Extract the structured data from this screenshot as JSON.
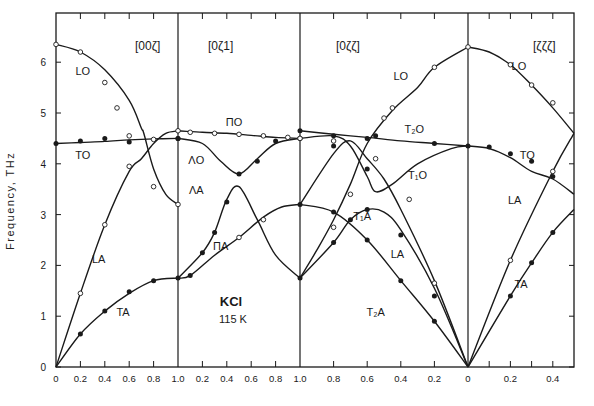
{
  "chart_data": {
    "type": "line",
    "title": "",
    "subtitle": "KCl 115 K",
    "annotation": {
      "material": "KCl",
      "temperature": "115 K"
    },
    "xlabel": "",
    "ylabel": "Frequency,   THz",
    "ylim": [
      0,
      7
    ],
    "yticks": [
      0,
      1,
      2,
      3,
      4,
      5,
      6
    ],
    "grid": false,
    "legend": "none (curve labels inline)",
    "sections": [
      {
        "label": "[00ζ]",
        "xticks": [
          "0",
          "0.2",
          "0.4",
          "0.6",
          "0.8",
          "1.0"
        ],
        "range": [
          0,
          1.0
        ]
      },
      {
        "label": "[0ζ1]",
        "xticks": [
          "0.2",
          "0.4",
          "0.6",
          "0.8",
          "1.0"
        ],
        "range": [
          0,
          1.0
        ]
      },
      {
        "label": "[0ζζ]",
        "xticks": [
          "0.8",
          "0.6",
          "0.4",
          "0.2",
          "0"
        ],
        "range": [
          1.0,
          0
        ]
      },
      {
        "label": "[ζζζ]",
        "xticks": [
          "0.2",
          "0.4"
        ],
        "range": [
          0,
          0.5
        ]
      }
    ],
    "series": [
      {
        "name": "LO",
        "section": 0,
        "points": [
          [
            0,
            6.35
          ],
          [
            0.2,
            6.2
          ],
          [
            0.4,
            5.85
          ],
          [
            0.6,
            5.25
          ],
          [
            0.7,
            4.7
          ],
          [
            0.72,
            4.6
          ],
          [
            0.8,
            3.9
          ],
          [
            0.9,
            3.4
          ],
          [
            1.0,
            3.2
          ]
        ]
      },
      {
        "name": "TO",
        "section": 0,
        "points": [
          [
            0,
            4.4
          ],
          [
            0.2,
            4.42
          ],
          [
            0.4,
            4.44
          ],
          [
            0.6,
            4.47
          ],
          [
            0.8,
            4.49
          ],
          [
            1.0,
            4.5
          ]
        ]
      },
      {
        "name": "LA",
        "section": 0,
        "points": [
          [
            0,
            0
          ],
          [
            0.2,
            1.45
          ],
          [
            0.4,
            2.8
          ],
          [
            0.6,
            3.85
          ],
          [
            0.7,
            4.1
          ],
          [
            0.8,
            4.4
          ],
          [
            0.9,
            4.6
          ],
          [
            1.0,
            4.65
          ]
        ]
      },
      {
        "name": "TA",
        "section": 0,
        "points": [
          [
            0,
            0
          ],
          [
            0.2,
            0.65
          ],
          [
            0.4,
            1.1
          ],
          [
            0.6,
            1.45
          ],
          [
            0.8,
            1.7
          ],
          [
            1.0,
            1.75
          ]
        ]
      },
      {
        "name": "ΠO",
        "section": 1,
        "points": [
          [
            0,
            4.65
          ],
          [
            0.2,
            4.62
          ],
          [
            0.4,
            4.6
          ],
          [
            0.6,
            4.56
          ],
          [
            0.8,
            4.52
          ],
          [
            1.0,
            4.5
          ]
        ]
      },
      {
        "name": "ΛO",
        "section": 1,
        "points": [
          [
            0,
            4.5
          ],
          [
            0.2,
            4.4
          ],
          [
            0.35,
            4.05
          ],
          [
            0.5,
            3.8
          ],
          [
            0.65,
            4.1
          ],
          [
            0.8,
            4.4
          ],
          [
            1.0,
            4.5
          ]
        ]
      },
      {
        "name": "ΛA",
        "section": 1,
        "points": [
          [
            0,
            1.75
          ],
          [
            0.2,
            2.25
          ],
          [
            0.3,
            2.65
          ],
          [
            0.4,
            3.3
          ],
          [
            0.5,
            3.55
          ],
          [
            0.65,
            2.9
          ],
          [
            0.8,
            2.2
          ],
          [
            1.0,
            1.75
          ]
        ]
      },
      {
        "name": "ΠA",
        "section": 1,
        "points": [
          [
            0,
            1.75
          ],
          [
            0.1,
            1.8
          ],
          [
            0.3,
            2.2
          ],
          [
            0.5,
            2.55
          ],
          [
            0.7,
            2.95
          ],
          [
            0.85,
            3.15
          ],
          [
            1.0,
            3.2
          ]
        ]
      },
      {
        "name": "LO",
        "section": 2,
        "points": [
          [
            1.0,
            1.75
          ],
          [
            0.9,
            2.3
          ],
          [
            0.8,
            2.9
          ],
          [
            0.7,
            3.6
          ],
          [
            0.6,
            4.4
          ],
          [
            0.45,
            5.05
          ],
          [
            0.3,
            5.5
          ],
          [
            0.2,
            5.9
          ],
          [
            0,
            6.3
          ]
        ]
      },
      {
        "name": "T2O",
        "section": 2,
        "points": [
          [
            1.0,
            4.65
          ],
          [
            0.8,
            4.58
          ],
          [
            0.6,
            4.52
          ],
          [
            0.4,
            4.45
          ],
          [
            0.2,
            4.4
          ],
          [
            0,
            4.35
          ]
        ]
      },
      {
        "name": "T1O",
        "section": 2,
        "points": [
          [
            1.0,
            4.5
          ],
          [
            0.8,
            4.55
          ],
          [
            0.7,
            4.35
          ],
          [
            0.6,
            3.75
          ],
          [
            0.55,
            3.45
          ],
          [
            0.45,
            3.6
          ],
          [
            0.3,
            4.0
          ],
          [
            0.1,
            4.3
          ],
          [
            0,
            4.35
          ]
        ]
      },
      {
        "name": "T1A",
        "section": 2,
        "points": [
          [
            1.0,
            1.75
          ],
          [
            0.8,
            2.45
          ],
          [
            0.7,
            2.9
          ],
          [
            0.6,
            3.1
          ],
          [
            0.5,
            3.05
          ],
          [
            0.4,
            2.7
          ],
          [
            0.2,
            1.55
          ],
          [
            0,
            0
          ]
        ]
      },
      {
        "name": "LA",
        "section": 2,
        "points": [
          [
            1.0,
            3.2
          ],
          [
            0.8,
            4.2
          ],
          [
            0.7,
            4.45
          ],
          [
            0.6,
            4.1
          ],
          [
            0.5,
            3.7
          ],
          [
            0.4,
            3.1
          ],
          [
            0.2,
            1.7
          ],
          [
            0,
            0
          ]
        ]
      },
      {
        "name": "T2A",
        "section": 2,
        "points": [
          [
            1.0,
            3.2
          ],
          [
            0.8,
            3.05
          ],
          [
            0.6,
            2.5
          ],
          [
            0.4,
            1.7
          ],
          [
            0.2,
            0.9
          ],
          [
            0,
            0
          ]
        ]
      },
      {
        "name": "LO",
        "section": 3,
        "points": [
          [
            0,
            6.3
          ],
          [
            0.1,
            6.2
          ],
          [
            0.2,
            5.95
          ],
          [
            0.3,
            5.55
          ],
          [
            0.4,
            5.1
          ],
          [
            0.5,
            4.6
          ]
        ]
      },
      {
        "name": "TO",
        "section": 3,
        "points": [
          [
            0,
            4.35
          ],
          [
            0.1,
            4.3
          ],
          [
            0.2,
            4.12
          ],
          [
            0.3,
            3.85
          ],
          [
            0.4,
            3.7
          ],
          [
            0.5,
            3.4
          ]
        ]
      },
      {
        "name": "LA",
        "section": 3,
        "points": [
          [
            0,
            0
          ],
          [
            0.2,
            2.1
          ],
          [
            0.4,
            3.85
          ],
          [
            0.5,
            4.6
          ]
        ]
      },
      {
        "name": "TA",
        "section": 3,
        "points": [
          [
            0,
            0
          ],
          [
            0.2,
            1.4
          ],
          [
            0.3,
            2.05
          ],
          [
            0.4,
            2.65
          ],
          [
            0.5,
            3.1
          ]
        ]
      }
    ],
    "curve_labels": [
      {
        "text": "LO",
        "section": 0,
        "x": 0.22,
        "y": 5.75
      },
      {
        "text": "TO",
        "section": 0,
        "x": 0.22,
        "y": 4.1
      },
      {
        "text": "LA",
        "section": 0,
        "x": 0.35,
        "y": 2.05
      },
      {
        "text": "TA",
        "section": 0,
        "x": 0.55,
        "y": 1.0
      },
      {
        "text": "ΠO",
        "section": 1,
        "x": 0.46,
        "y": 4.75
      },
      {
        "text": "ΛO",
        "section": 1,
        "x": 0.15,
        "y": 4.0
      },
      {
        "text": "ΛA",
        "section": 1,
        "x": 0.15,
        "y": 3.4
      },
      {
        "text": "ΠA",
        "section": 1,
        "x": 0.35,
        "y": 2.3
      },
      {
        "text": "LO",
        "section": 2,
        "x": 0.4,
        "y": 5.65
      },
      {
        "text": "T₂O",
        "section": 2,
        "x": 0.32,
        "y": 4.6
      },
      {
        "text": "T₁O",
        "section": 2,
        "x": 0.3,
        "y": 3.7
      },
      {
        "text": "T₁A",
        "section": 2,
        "x": 0.63,
        "y": 2.9
      },
      {
        "text": "LA",
        "section": 2,
        "x": 0.42,
        "y": 2.15
      },
      {
        "text": "T₂A",
        "section": 2,
        "x": 0.55,
        "y": 1.0
      },
      {
        "text": "LO",
        "section": 3,
        "x": 0.24,
        "y": 5.85
      },
      {
        "text": "TO",
        "section": 3,
        "x": 0.28,
        "y": 4.1
      },
      {
        "text": "LA",
        "section": 3,
        "x": 0.22,
        "y": 3.2
      },
      {
        "text": "TA",
        "section": 3,
        "x": 0.25,
        "y": 1.55
      }
    ],
    "markers": {
      "open": [
        [
          0,
          0,
          6.35
        ],
        [
          0,
          0.2,
          6.2
        ],
        [
          0,
          0.4,
          5.6
        ],
        [
          0,
          0.5,
          5.1
        ],
        [
          0,
          0.6,
          4.55
        ],
        [
          0,
          0.8,
          3.55
        ],
        [
          0,
          1.0,
          3.2
        ],
        [
          0,
          0.2,
          1.45
        ],
        [
          0,
          0.4,
          2.8
        ],
        [
          0,
          0.6,
          3.95
        ],
        [
          0,
          0.8,
          4.48
        ],
        [
          1,
          0,
          4.65
        ],
        [
          1,
          0.1,
          4.62
        ],
        [
          1,
          0.3,
          4.6
        ],
        [
          1,
          0.5,
          4.58
        ],
        [
          1,
          0.7,
          4.55
        ],
        [
          1,
          0.9,
          4.52
        ],
        [
          1,
          1.0,
          4.5
        ],
        [
          1,
          0.7,
          2.9
        ],
        [
          1,
          0.5,
          2.55
        ],
        [
          2,
          0.8,
          2.75
        ],
        [
          2,
          0.8,
          4.45
        ],
        [
          2,
          0.7,
          3.4
        ],
        [
          2,
          0.55,
          4.1
        ],
        [
          2,
          0.45,
          5.1
        ],
        [
          2,
          0.35,
          3.3
        ],
        [
          2,
          0.2,
          1.65
        ],
        [
          2,
          0.2,
          5.9
        ],
        [
          2,
          0.5,
          4.9
        ],
        [
          2,
          0,
          6.3
        ],
        [
          2,
          1.0,
          4.5
        ],
        [
          3,
          0.2,
          5.95
        ],
        [
          3,
          0.3,
          5.55
        ],
        [
          3,
          0.4,
          5.2
        ],
        [
          3,
          0.2,
          2.1
        ],
        [
          3,
          0.4,
          3.85
        ]
      ],
      "filled": [
        [
          0,
          0,
          4.4
        ],
        [
          0,
          0.2,
          4.45
        ],
        [
          0,
          0.4,
          4.5
        ],
        [
          0,
          0.6,
          4.43
        ],
        [
          0,
          1.0,
          4.5
        ],
        [
          0,
          0.2,
          0.65
        ],
        [
          0,
          0.4,
          1.1
        ],
        [
          0,
          0.6,
          1.48
        ],
        [
          0,
          0.8,
          1.7
        ],
        [
          0,
          1.0,
          1.75
        ],
        [
          1,
          0,
          4.5
        ],
        [
          1,
          0.5,
          3.8
        ],
        [
          1,
          0.65,
          4.05
        ],
        [
          1,
          0.8,
          4.45
        ],
        [
          1,
          0.1,
          1.8
        ],
        [
          1,
          0.2,
          2.25
        ],
        [
          1,
          0.3,
          2.65
        ],
        [
          1,
          0.4,
          3.25
        ],
        [
          1,
          1.0,
          3.2
        ],
        [
          1,
          1.0,
          1.75
        ],
        [
          2,
          1.0,
          4.65
        ],
        [
          2,
          0.8,
          4.55
        ],
        [
          2,
          0.6,
          4.5
        ],
        [
          2,
          0.55,
          4.55
        ],
        [
          2,
          0.2,
          4.4
        ],
        [
          2,
          0.8,
          4.35
        ],
        [
          2,
          0.6,
          3.9
        ],
        [
          2,
          0.6,
          3.1
        ],
        [
          2,
          0.4,
          2.6
        ],
        [
          2,
          0.2,
          1.4
        ],
        [
          2,
          0.8,
          2.45
        ],
        [
          2,
          0.7,
          2.9
        ],
        [
          2,
          0.6,
          2.5
        ],
        [
          2,
          0.4,
          1.7
        ],
        [
          2,
          0.2,
          0.9
        ],
        [
          2,
          0.8,
          3.05
        ],
        [
          3,
          0,
          4.35
        ],
        [
          3,
          0.1,
          4.33
        ],
        [
          3,
          0.2,
          4.2
        ],
        [
          3,
          0.3,
          4.05
        ],
        [
          3,
          0.4,
          3.75
        ],
        [
          3,
          0.2,
          1.4
        ],
        [
          3,
          0.3,
          2.05
        ],
        [
          3,
          0.4,
          2.65
        ]
      ]
    }
  },
  "axis": {
    "ylabel": "Frequency,   THz",
    "yticks": [
      "0",
      "1",
      "2",
      "3",
      "4",
      "5",
      "6"
    ],
    "section_labels": [
      "[00ζ]",
      "[0ζ1]",
      "[0ζζ]",
      "[ζζζ]"
    ]
  },
  "annotation": {
    "material": "KCl",
    "temperature": "115 K"
  },
  "colors": {
    "ink": "#1a1a1a",
    "background": "#ffffff"
  }
}
